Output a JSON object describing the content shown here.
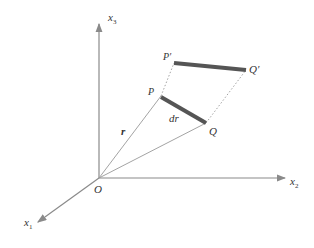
{
  "diagram": {
    "axes": {
      "x1": {
        "name": "x",
        "sub": "1"
      },
      "x2": {
        "name": "x",
        "sub": "2"
      },
      "x3": {
        "name": "x",
        "sub": "3"
      }
    },
    "points": {
      "origin": "O",
      "P": "P",
      "Q": "Q",
      "P_prime": "P′",
      "Q_prime": "Q′"
    },
    "vectors": {
      "r": "r",
      "dr": "dr"
    },
    "colors": {
      "axis": "#8a8a8a",
      "thick_segment": "#555555",
      "thin": "#999999"
    }
  }
}
